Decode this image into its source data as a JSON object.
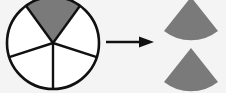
{
  "diagram": {
    "circle": {
      "sectors": 5,
      "shaded_sectors": 1,
      "shaded_color": "#7a7a7a",
      "unshaded_color": "#ffffff",
      "stroke_color": "#111111"
    },
    "arrow": {
      "direction": "right",
      "color": "#111111"
    },
    "pieces": [
      {
        "shape": "sector",
        "color": "#7a7a7a"
      },
      {
        "shape": "sector",
        "color": "#7a7a7a"
      }
    ],
    "background": "#f4f4f4"
  }
}
